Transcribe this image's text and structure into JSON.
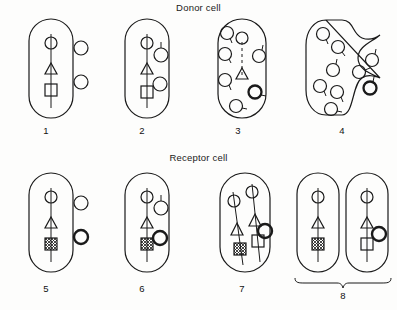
{
  "figure": {
    "title_donor": "Donor cell",
    "title_receptor": "Receptor cell",
    "background_color": "#fdfdfc",
    "ink_color": "#1a1a1a"
  },
  "rows": {
    "donor": {
      "label": "Donor cell",
      "panels": [
        {
          "number": "1",
          "name": "intact-donor-cell",
          "description": "Intact donor cell with chromosome bearing circle, triangle and square markers; two free plasmid circles outside the cell on the right."
        },
        {
          "number": "2",
          "name": "donor-cell-plasmids-internalized",
          "description": "Donor cell with the two circles now inside the cell adjacent to the chromosome."
        },
        {
          "number": "3",
          "name": "donor-chromosome-fragmenting",
          "description": "Donor cell in which the chromosome is breaking up; a dashed remnant with circle and triangle remains while six tailed circles are dispersed in the cytoplasm."
        },
        {
          "number": "4",
          "name": "donor-cell-lysing",
          "description": "Lysing donor cell with a ruptured wavy right membrane releasing tailed circles."
        }
      ]
    },
    "receptor": {
      "label": "Receptor cell",
      "panels": [
        {
          "number": "5",
          "name": "receptor-cell-uptake",
          "description": "Receptor cell with chromosome carrying circle, triangle and hatched square; two circles outside on the right, the lower one drawn bold."
        },
        {
          "number": "6",
          "name": "receptor-cell-integration",
          "description": "Receptor cell with circles drawn inside; a bold circle sits beside the hatched square on the chromosome."
        },
        {
          "number": "7",
          "name": "receptor-cell-replicated-chromosomes",
          "description": "Receptor cell containing two slanted chromosome strands, one with a hatched square and one with a plain square plus an attached bold circle."
        },
        {
          "number": "8",
          "name": "daughter-cells-pair",
          "description": "Two daughter cells joined by a brace: the left carries the hatched square, the right carries a plain square with an attached bold circle."
        }
      ]
    }
  },
  "legend_glyphs": {
    "circle_marker": "circle-marker",
    "triangle_marker": "triangle-marker",
    "square_marker": "square-marker",
    "hatched_square_marker": "hatched-square-marker",
    "bold_circle_marker": "bold-circle-marker",
    "plasmid_circle": "plasmid-circle"
  }
}
